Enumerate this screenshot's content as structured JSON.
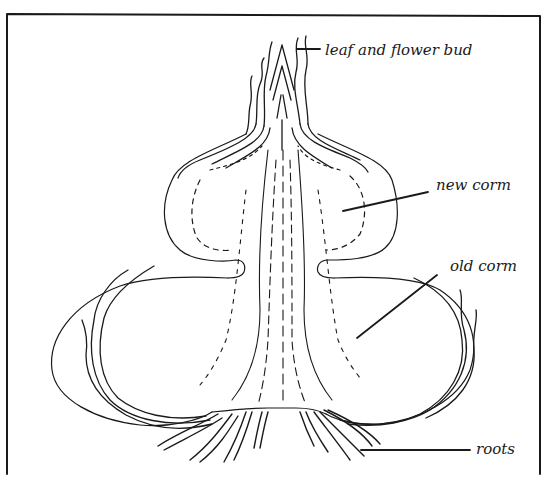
{
  "diagram": {
    "type": "labeled botanical cross-section",
    "subject": "corm",
    "frame": {
      "stroke": "#1a1a1a",
      "background": "#ffffff"
    },
    "labels": [
      {
        "id": "bud",
        "text": "leaf and flower bud"
      },
      {
        "id": "new",
        "text": "new corm"
      },
      {
        "id": "old",
        "text": "old corm"
      },
      {
        "id": "roots",
        "text": "roots"
      }
    ],
    "ink_color": "#1a1a1a"
  }
}
